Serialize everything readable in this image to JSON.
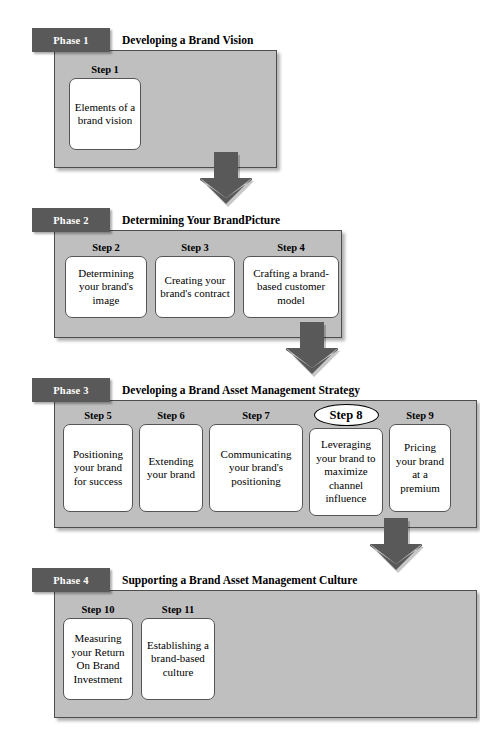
{
  "document": {
    "kind": "flow-diagram",
    "title": "Brand Asset Management Phases and Steps"
  },
  "colors": {
    "phase_tag_bg": "#595959",
    "phase_tag_text": "#ffffff",
    "phase_body_bg": "#bfbfbf",
    "phase_body_border": "#4d4d4d",
    "step_box_bg": "#ffffff",
    "step_box_border": "#555555",
    "arrow_fill": "#595959",
    "page_bg": "#ffffff",
    "text": "#000000"
  },
  "phases": [
    {
      "tag": "Phase 1",
      "title": "Developing a Brand Vision",
      "steps": [
        {
          "label": "Step 1",
          "highlighted": false,
          "text": "Elements of a brand vision"
        }
      ]
    },
    {
      "tag": "Phase 2",
      "title": "Determining Your BrandPicture",
      "steps": [
        {
          "label": "Step 2",
          "highlighted": false,
          "text": "Determining your brand's image"
        },
        {
          "label": "Step 3",
          "highlighted": false,
          "text": "Creating your brand's contract"
        },
        {
          "label": "Step 4",
          "highlighted": false,
          "text": "Crafting a brand-based customer model"
        }
      ]
    },
    {
      "tag": "Phase 3",
      "title": "Developing a Brand Asset Management Strategy",
      "steps": [
        {
          "label": "Step 5",
          "highlighted": false,
          "text": "Positioning your brand for success"
        },
        {
          "label": "Step 6",
          "highlighted": false,
          "text": "Extending your brand"
        },
        {
          "label": "Step 7",
          "highlighted": false,
          "text": "Communicating your brand's positioning"
        },
        {
          "label": "Step 8",
          "highlighted": true,
          "text": "Leveraging your brand to maximize channel influence"
        },
        {
          "label": "Step 9",
          "highlighted": false,
          "text": "Pricing your brand at a premium"
        }
      ]
    },
    {
      "tag": "Phase 4",
      "title": "Supporting a Brand Asset Management Culture",
      "steps": [
        {
          "label": "Step 10",
          "highlighted": false,
          "text": "Measuring your Return On Brand Investment"
        },
        {
          "label": "Step 11",
          "highlighted": false,
          "text": "Establishing a brand-based culture"
        }
      ]
    }
  ],
  "connectors": [
    {
      "name": "arrow-phase1-to-phase2",
      "from": "Phase 1",
      "to": "Phase 2",
      "direction": "down"
    },
    {
      "name": "arrow-phase2-to-phase3",
      "from": "Phase 2",
      "to": "Phase 3",
      "direction": "down"
    },
    {
      "name": "arrow-phase3-to-phase4",
      "from": "Phase 3",
      "to": "Phase 4",
      "direction": "down"
    }
  ]
}
